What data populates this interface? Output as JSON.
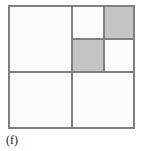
{
  "figure": {
    "caption": "(f)",
    "colors": {
      "background": "#ffffff",
      "cell_fill": "#fbfbfb",
      "shaded_fill": "#c5c5c5",
      "line": "#808080",
      "caption_text": "#1a1a1a"
    },
    "outer_square": {
      "label": "outer-square",
      "border_width_px": 2
    },
    "quadrants": [
      {
        "id": "top-left",
        "state": "empty",
        "shaded": false,
        "subdivided": false
      },
      {
        "id": "top-right",
        "state": "subdivided",
        "shaded": false,
        "subdivided": true
      },
      {
        "id": "bottom-left",
        "state": "empty",
        "shaded": false,
        "subdivided": false
      },
      {
        "id": "bottom-right",
        "state": "empty",
        "shaded": false,
        "subdivided": false
      }
    ],
    "subcells": [
      {
        "id": "top-right.top-left",
        "shaded": false
      },
      {
        "id": "top-right.top-right",
        "shaded": true
      },
      {
        "id": "top-right.bottom-left",
        "shaded": true
      },
      {
        "id": "top-right.bottom-right",
        "shaded": false
      }
    ],
    "dividers": [
      {
        "id": "main-vertical",
        "orientation": "vertical"
      },
      {
        "id": "main-horizontal",
        "orientation": "horizontal"
      },
      {
        "id": "sub-vertical",
        "orientation": "vertical"
      },
      {
        "id": "sub-horizontal",
        "orientation": "horizontal"
      }
    ]
  },
  "chart_data": {
    "type": "heatmap",
    "title": "(f)",
    "xlabel": "",
    "ylabel": "",
    "grid": true,
    "categories": [
      "top-left",
      "top-right",
      "bottom-left",
      "bottom-right"
    ],
    "values": [
      0,
      1,
      0,
      0
    ],
    "subcell_categories": [
      "top-right.top-left",
      "top-right.top-right",
      "top-right.bottom-left",
      "top-right.bottom-right"
    ],
    "subcell_values": [
      0,
      1,
      1,
      0
    ]
  }
}
